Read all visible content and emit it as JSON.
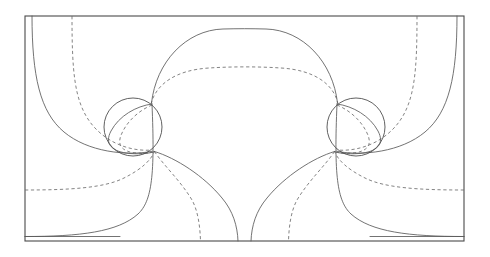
{
  "figure": {
    "title": "",
    "background_color": "#ffffff",
    "frame_color": "#4a4a4a",
    "solid_stroke_color": "#5a5a5a",
    "dashed_stroke_color": "#6e6e6e",
    "cylinder_stroke_color": "#4f4f4f"
  },
  "chart_data": {
    "type": "line",
    "title": "",
    "subtitle": "",
    "xlabel": "",
    "ylabel": "",
    "grid": false,
    "legend": null,
    "axis_ranges": {
      "xlim": [
        25,
        464
      ],
      "ylim": [
        16,
        241
      ]
    },
    "frame": {
      "x": 25,
      "y": 16,
      "width": 439,
      "height": 225
    },
    "symmetry_axis_x": 244.5,
    "cylinders": [
      {
        "name": "left-cylinder",
        "cx": 133,
        "cy": 127,
        "r": 29
      },
      {
        "name": "right-cylinder",
        "cx": 356,
        "cy": 127,
        "r": 29
      }
    ],
    "stagnation_points": [
      {
        "name": "left-upper",
        "x": 152,
        "y": 105
      },
      {
        "name": "left-lower",
        "x": 155,
        "y": 152
      },
      {
        "name": "right-upper",
        "x": 337,
        "y": 105
      },
      {
        "name": "right-lower",
        "x": 334,
        "y": 152
      }
    ],
    "solid_streamlines": [
      {
        "name": "top-arch",
        "peak_y": 29,
        "span_x": [
          152,
          337
        ]
      },
      {
        "name": "left-outer-descending",
        "start": [
          32,
          16
        ],
        "end": [
          152,
          105
        ]
      },
      {
        "name": "right-outer-descending",
        "start": [
          458,
          16
        ],
        "end": [
          337,
          105
        ]
      },
      {
        "name": "left-lower-sweep",
        "start": [
          25,
          236
        ],
        "end": [
          155,
          152
        ]
      },
      {
        "name": "right-lower-sweep",
        "start": [
          464,
          236
        ],
        "end": [
          334,
          152
        ]
      },
      {
        "name": "centre-stem-left",
        "start": [
          155,
          152
        ],
        "end": [
          238,
          241
        ]
      },
      {
        "name": "centre-stem-right",
        "start": [
          334,
          152
        ],
        "end": [
          257,
          241
        ]
      },
      {
        "name": "bottom-left-rail",
        "y": 236,
        "span_x": [
          25,
          120
        ]
      },
      {
        "name": "bottom-right-rail",
        "y": 236,
        "span_x": [
          370,
          464
        ]
      }
    ],
    "dashed_contours": [
      {
        "name": "top-dashed-arch",
        "peak_y": 68,
        "span_x": [
          152,
          337
        ]
      },
      {
        "name": "left-dashed-vertical",
        "start": [
          72,
          16
        ],
        "end": [
          152,
          105
        ]
      },
      {
        "name": "right-dashed-vertical",
        "start": [
          418,
          16
        ],
        "end": [
          337,
          105
        ]
      },
      {
        "name": "left-dashed-horizontal",
        "y": 190,
        "span_x": [
          25,
          120
        ]
      },
      {
        "name": "right-dashed-horizontal",
        "y": 190,
        "span_x": [
          370,
          464
        ]
      },
      {
        "name": "left-dashed-stem",
        "start": [
          155,
          152
        ],
        "end": [
          200,
          241
        ]
      },
      {
        "name": "right-dashed-stem",
        "start": [
          334,
          152
        ],
        "end": [
          291,
          241
        ]
      }
    ]
  }
}
